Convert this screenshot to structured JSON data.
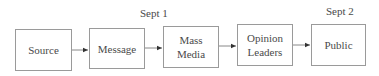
{
  "diagram": {
    "nodes": [
      {
        "id": "source",
        "label": "Source"
      },
      {
        "id": "message",
        "label": "Message"
      },
      {
        "id": "mass_media",
        "label": "Mass\nMedia"
      },
      {
        "id": "opinion_leaders",
        "label": "Opinion\nLeaders"
      },
      {
        "id": "public",
        "label": "Public"
      }
    ],
    "edges": [
      {
        "from": "source",
        "to": "message"
      },
      {
        "from": "message",
        "to": "mass_media"
      },
      {
        "from": "mass_media",
        "to": "opinion_leaders"
      },
      {
        "from": "opinion_leaders",
        "to": "public"
      }
    ],
    "annotations": [
      {
        "text": "Sept 1",
        "above": "message_to_mass_media"
      },
      {
        "text": "Sept 2",
        "above": "public"
      }
    ]
  },
  "labels": {
    "source": "Source",
    "message": "Message",
    "mass_line1": "Mass",
    "mass_line2": "Media",
    "opinion_line1": "Opinion",
    "opinion_line2": "Leaders",
    "public": "Public",
    "sept1": "Sept 1",
    "sept2": "Sept 2"
  }
}
